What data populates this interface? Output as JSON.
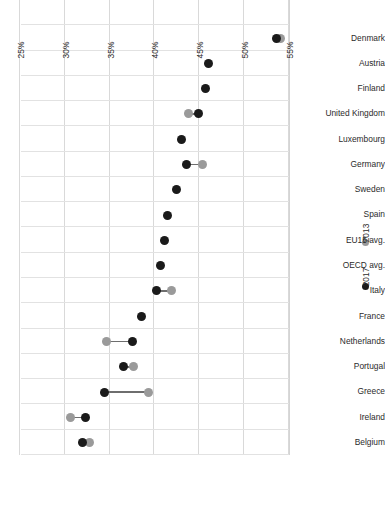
{
  "chart": {
    "type": "dumbbell",
    "orientation": "horizontal-bars-rotated-180"
  },
  "legend": {
    "position": "right-middle",
    "items": [
      {
        "label": "2017",
        "color": "#1a1a1a"
      },
      {
        "label": "2013",
        "color": "#9a9a9a"
      }
    ]
  },
  "axis": {
    "x_ticks": [
      "55%",
      "50%",
      "45%",
      "40%",
      "35%",
      "30%",
      "25%"
    ],
    "x_min_label": "25%",
    "x_max_label": "55%",
    "reversed": true
  },
  "edge_fragments": {
    "f1": "b",
    "f2": "r",
    "f3": "o",
    "f4": "1",
    "f5": "b"
  },
  "chart_data": {
    "type": "scatter",
    "title": "",
    "xlabel": "",
    "ylabel": "",
    "xlim": [
      55,
      25
    ],
    "grid": true,
    "legend_position": "right",
    "categories": [
      "Belgium",
      "Ireland",
      "Greece",
      "Portugal",
      "Netherlands",
      "France",
      "Italy",
      "OECD avg.",
      "EU15 avg.",
      "Spain",
      "Sweden",
      "Germany",
      "Luxembourg",
      "United Kingdom",
      "Finland",
      "Austria",
      "Denmark"
    ],
    "series": [
      {
        "name": "2013",
        "color": "#9a9a9a",
        "values": [
          32.8,
          30.6,
          39.3,
          37.7,
          34.6,
          null,
          41.9,
          null,
          null,
          null,
          null,
          45.4,
          null,
          43.8,
          null,
          null,
          54.1
        ]
      },
      {
        "name": "2017",
        "color": "#1a1a1a",
        "values": [
          32.0,
          32.3,
          34.4,
          36.5,
          37.5,
          38.6,
          40.2,
          40.7,
          41.1,
          41.4,
          42.5,
          43.6,
          43.0,
          44.9,
          45.7,
          46.0,
          53.6
        ]
      }
    ],
    "points": [
      {
        "category": "Belgium",
        "v2013": 32.8,
        "v2017": 32.0
      },
      {
        "category": "Ireland",
        "v2013": 30.6,
        "v2017": 32.3
      },
      {
        "category": "Greece",
        "v2013": 39.3,
        "v2017": 34.4
      },
      {
        "category": "Portugal",
        "v2013": 37.7,
        "v2017": 36.5
      },
      {
        "category": "Netherlands",
        "v2013": 34.6,
        "v2017": 37.5
      },
      {
        "category": "France",
        "v2013": null,
        "v2017": 38.6
      },
      {
        "category": "Italy",
        "v2013": 41.9,
        "v2017": 40.2
      },
      {
        "category": "OECD avg.",
        "v2013": null,
        "v2017": 40.7
      },
      {
        "category": "EU15 avg.",
        "v2013": null,
        "v2017": 41.1
      },
      {
        "category": "Spain",
        "v2013": null,
        "v2017": 41.4
      },
      {
        "category": "Sweden",
        "v2013": null,
        "v2017": 42.5
      },
      {
        "category": "Germany",
        "v2013": 45.4,
        "v2017": 43.6
      },
      {
        "category": "Luxembourg",
        "v2013": null,
        "v2017": 43.0
      },
      {
        "category": "United Kingdom",
        "v2013": 43.8,
        "v2017": 44.9
      },
      {
        "category": "Finland",
        "v2013": null,
        "v2017": 45.7
      },
      {
        "category": "Austria",
        "v2013": null,
        "v2017": 46.0
      },
      {
        "category": "Denmark",
        "v2013": 54.1,
        "v2017": 53.6
      }
    ]
  }
}
